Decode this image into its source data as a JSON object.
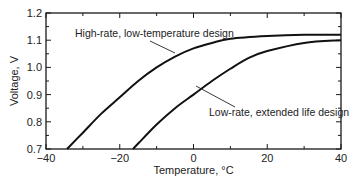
{
  "chart_data": {
    "type": "line",
    "title": "",
    "xlabel": "Temperature, °C",
    "ylabel": "Voltage, V",
    "xlim": [
      -40,
      40
    ],
    "ylim": [
      0.7,
      1.2
    ],
    "x_ticks": [
      -40,
      -20,
      0,
      20,
      40
    ],
    "x_tick_labels": [
      "−40",
      "−20",
      "0",
      "20",
      "40"
    ],
    "y_ticks": [
      0.7,
      0.8,
      0.9,
      1.0,
      1.1,
      1.2
    ],
    "y_tick_labels": [
      "0.7",
      "0.8",
      "0.9",
      "1.0",
      "1.1",
      "1.2"
    ],
    "grid": false,
    "legend": "none (curves labeled by callout annotations)",
    "series": [
      {
        "name": "High-rate, low-temperature design",
        "x": [
          -34.3,
          -30,
          -25,
          -20,
          -15,
          -10,
          -5,
          0,
          5,
          10,
          20,
          30,
          40
        ],
        "y": [
          0.7,
          0.76,
          0.83,
          0.89,
          0.95,
          1.0,
          1.04,
          1.07,
          1.09,
          1.105,
          1.115,
          1.12,
          1.12
        ]
      },
      {
        "name": "Low-rate, extended life design",
        "x": [
          -16.4,
          -15,
          -10,
          -5,
          0,
          5,
          10,
          15,
          20,
          30,
          40
        ],
        "y": [
          0.7,
          0.72,
          0.79,
          0.85,
          0.9,
          0.95,
          0.995,
          1.035,
          1.06,
          1.09,
          1.1
        ]
      }
    ],
    "annotations": [
      {
        "text": "High-rate, low-temperature design",
        "points_to_series": 0
      },
      {
        "text": "Low-rate, extended life design",
        "points_to_series": 1
      }
    ]
  }
}
